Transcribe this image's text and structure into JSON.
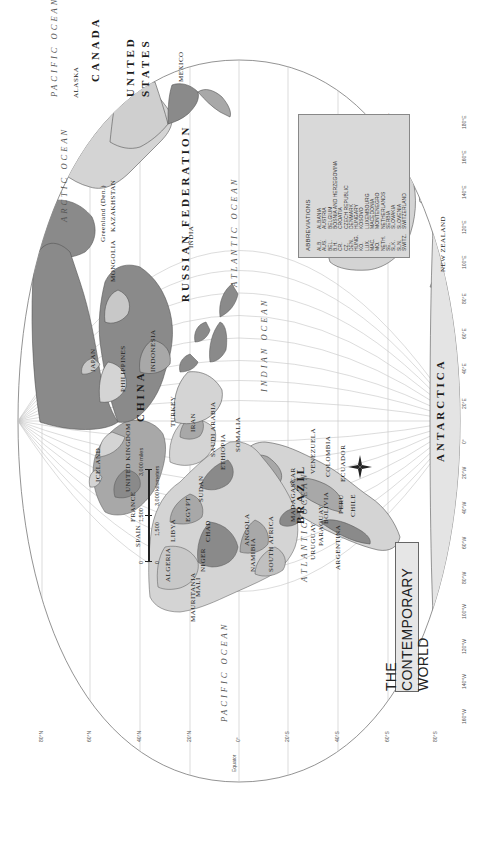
{
  "map": {
    "title": "THE CONTEMPORARY WORLD",
    "projection": "oval world projection, rotated 90° counter-clockwise",
    "colors": {
      "background": "#ffffff",
      "ocean": "#ffffff",
      "graticule": "#bdbdbd",
      "land_light": "#d4d4d4",
      "land_mid": "#a8a8a8",
      "land_dark": "#8a8a8a",
      "border": "#555555",
      "legend_bg": "#d9d9d9"
    },
    "oceans": [
      {
        "name": "ARCTIC OCEAN"
      },
      {
        "name": "PACIFIC OCEAN",
        "instance": "west"
      },
      {
        "name": "PACIFIC OCEAN",
        "instance": "east"
      },
      {
        "name": "ATLANTIC OCEAN",
        "instance": "north"
      },
      {
        "name": "ATLANTIC OCEAN",
        "instance": "south"
      },
      {
        "name": "INDIAN OCEAN"
      }
    ],
    "countries_large": [
      "CANADA",
      "UNITED STATES",
      "BRAZIL",
      "RUSSIAN FEDERATION",
      "CHINA",
      "AUSTRALIA",
      "ANTARCTICA",
      "INDIA",
      "MONGOLIA",
      "KAZAKHSTAN",
      "ALGERIA",
      "LIBYA",
      "SUDAN",
      "MALI",
      "NIGER",
      "CHAD",
      "MEXICO",
      "ARGENTINA"
    ],
    "countries_labeled": {
      "north_america": [
        "ALASKA",
        "CANADA",
        "UNITED STATES",
        "MEXICO",
        "CUBA",
        "BAHAMAS",
        "HAITI",
        "DOMINICAN REPUBLIC",
        "GUATEMALA",
        "EL SALVADOR",
        "HONDURAS",
        "NICARAGUA",
        "COSTA RICA",
        "PANAMA",
        "Greenland (Den.)",
        "ICELAND"
      ],
      "south_america": [
        "COLOMBIA",
        "VENEZUELA",
        "ECUADOR",
        "PERU",
        "BRAZIL",
        "BOLIVIA",
        "CHILE",
        "PARAGUAY",
        "URUGUAY",
        "ARGENTINA",
        "GUYANA",
        "SURINAME",
        "French Guiana (Fr.)",
        "TRINIDAD AND TOBAGO"
      ],
      "caribbean": [
        "ST. KITTS AND NEVIS",
        "ANTIGUA AND BARBUDA",
        "DOMINICA",
        "ST. VINCENT & THE GRENADINES",
        "BARBADOS",
        "GRENADA",
        "Puerto Rico (U.S.)"
      ],
      "europe": [
        "UNITED KINGDOM",
        "IRELAND",
        "NORWAY",
        "SWEDEN",
        "FINLAND",
        "ESTONIA",
        "LATVIA",
        "LITHUANIA",
        "BELARUS",
        "POLAND",
        "GERMANY",
        "FRANCE",
        "SPAIN",
        "PORTUGAL",
        "ITALY",
        "UKRAINE",
        "MOLDOVA",
        "ROMANIA",
        "BULGARIA",
        "GREECE",
        "TURKEY"
      ],
      "africa": [
        "MOROCCO",
        "Western Sahara",
        "ALGERIA",
        "TUNISIA",
        "LIBYA",
        "EGYPT",
        "MAURITANIA",
        "MALI",
        "NIGER",
        "CHAD",
        "SUDAN",
        "ERITREA",
        "ETHIOPIA",
        "SOMALIA",
        "DJIBOUTI",
        "CAPE VERDE",
        "SENEGAL",
        "GAMBIA",
        "GUINEA-BISSAU",
        "GUINEA",
        "SIERRA LEONE",
        "LIBERIA",
        "COTE D'IVOIRE",
        "BURKINA FASO",
        "GHANA",
        "TOGO",
        "BENIN",
        "NIGERIA",
        "CAMEROON",
        "CENTRAL AFRICAN REP.",
        "EQ. GUINEA",
        "GABON",
        "SAO TOME & PRINCIPE",
        "CONGO",
        "DEM. REP. OF THE CONGO",
        "UGANDA",
        "KENYA",
        "RWANDA",
        "BURUNDI",
        "TANZANIA",
        "ANGOLA",
        "ZAMBIA",
        "MALAWI",
        "MOZAMBIQUE",
        "ZIMBABWE",
        "NAMIBIA",
        "BOTSWANA",
        "SOUTH AFRICA",
        "SWAZILAND",
        "LESOTHO",
        "MADAGASCAR",
        "COMOROS",
        "SEYCHELLES",
        "MAURITIUS"
      ],
      "asia": [
        "RUSSIAN FEDERATION",
        "KAZAKHSTAN",
        "MONGOLIA",
        "CHINA",
        "JAPAN",
        "N. KOREA",
        "S. KOREA",
        "Taiwan",
        "INDIA",
        "PAKISTAN",
        "AFGHANISTAN",
        "IRAN",
        "IRAQ",
        "SYRIA",
        "SAUDI ARABIA",
        "YEMEN",
        "OMAN",
        "UNITED ARAB EMIRATES",
        "QATAR",
        "KUWAIT",
        "BHUTAN",
        "NEPAL",
        "BANGLADESH",
        "MYANMAR (BURMA)",
        "LAOS",
        "THAILAND",
        "VIETNAM",
        "CAMBODIA",
        "PHILIPPINES",
        "MALAYSIA",
        "BRUNEI",
        "SINGAPORE",
        "INDONESIA",
        "SRI LANKA",
        "MALDIVES",
        "TIMOR-LESTE",
        "UZBEKISTAN",
        "TURKMENISTAN",
        "KYRGYZSTAN",
        "TAJIKISTAN"
      ],
      "oceania": [
        "AUSTRALIA",
        "NEW ZEALAND",
        "PAPUA NEW GUINEA",
        "SOLOMON IS.",
        "VANUATU",
        "FIJI",
        "New Caledonia (Fr.)",
        "Tasmania (AUST.)",
        "PALAU",
        "FEDERATED STATES OF MICRONESIA",
        "MARSHALL IS.",
        "KIRIBATI",
        "NAURU",
        "TUVALU",
        "SAMOA",
        "TONGA",
        "Guam (U.S.)",
        "Mariana Is. (U.S.)",
        "Hawaii (U.S.)",
        "Easter I. (Chile)",
        "Galapagos Is. (Ec.)",
        "Falkland Is. (U.K.)",
        "Azores (Port.)",
        "Canary Is. (Sp.)"
      ]
    },
    "main_labels": [
      {
        "text": "RUSSIAN FEDERATION",
        "cls": "country-lg",
        "x": 540,
        "y": 180
      },
      {
        "text": "CHINA",
        "cls": "country-lg",
        "x": 420,
        "y": 135
      },
      {
        "text": "MONGOLIA",
        "cls": "country-md",
        "x": 560,
        "y": 110
      },
      {
        "text": "KAZAKHSTAN",
        "cls": "country-md",
        "x": 610,
        "y": 110
      },
      {
        "text": "INDIA",
        "cls": "country-md",
        "x": 594,
        "y": 188
      },
      {
        "text": "CANADA",
        "cls": "country-lg",
        "x": 760,
        "y": 90
      },
      {
        "text": "UNITED",
        "cls": "country-lg",
        "x": 745,
        "y": 125
      },
      {
        "text": "STATES",
        "cls": "country-lg",
        "x": 745,
        "y": 140
      },
      {
        "text": "MEXICO",
        "cls": "country-md",
        "x": 760,
        "y": 178
      },
      {
        "text": "ALASKA",
        "cls": "country-md",
        "x": 744,
        "y": 73
      },
      {
        "text": "BRAZIL",
        "cls": "country-lg",
        "x": 318,
        "y": 295
      },
      {
        "text": "PERU",
        "cls": "country-md",
        "x": 328,
        "y": 338
      },
      {
        "text": "CHILE",
        "cls": "country-md",
        "x": 325,
        "y": 350
      },
      {
        "text": "ARGENTINA",
        "cls": "country-md",
        "x": 272,
        "y": 335
      },
      {
        "text": "BOLIVIA",
        "cls": "country-md",
        "x": 318,
        "y": 323
      },
      {
        "text": "PARAGUAY",
        "cls": "country-md",
        "x": 296,
        "y": 318
      },
      {
        "text": "URUGUAY",
        "cls": "country-md",
        "x": 282,
        "y": 310
      },
      {
        "text": "COLOMBIA",
        "cls": "country-md",
        "x": 365,
        "y": 325
      },
      {
        "text": "VENEZUELA",
        "cls": "country-md",
        "x": 368,
        "y": 310
      },
      {
        "text": "ECUADOR",
        "cls": "country-md",
        "x": 360,
        "y": 340
      },
      {
        "text": "AUSTRALIA",
        "cls": "country-lg",
        "x": 640,
        "y": 380
      },
      {
        "text": "NEW ZEALAND",
        "cls": "country-md",
        "x": 570,
        "y": 440
      },
      {
        "text": "ANTARCTICA",
        "cls": "country-lg",
        "x": 380,
        "y": 435
      },
      {
        "text": "ALGERIA",
        "cls": "country-md",
        "x": 260,
        "y": 165
      },
      {
        "text": "LIBYA",
        "cls": "country-md",
        "x": 300,
        "y": 170
      },
      {
        "text": "EGYPT",
        "cls": "country-md",
        "x": 320,
        "y": 185
      },
      {
        "text": "SUDAN",
        "cls": "country-md",
        "x": 340,
        "y": 198
      },
      {
        "text": "MALI",
        "cls": "country-md",
        "x": 245,
        "y": 195
      },
      {
        "text": "NIGER",
        "cls": "country-md",
        "x": 270,
        "y": 200
      },
      {
        "text": "CHAD",
        "cls": "country-md",
        "x": 300,
        "y": 205
      },
      {
        "text": "MAURITANIA",
        "cls": "country-md",
        "x": 220,
        "y": 190
      },
      {
        "text": "ANGOLA",
        "cls": "country-md",
        "x": 296,
        "y": 244
      },
      {
        "text": "NAMIBIA",
        "cls": "country-md",
        "x": 270,
        "y": 250
      },
      {
        "text": "SOUTH AFRICA",
        "cls": "country-md",
        "x": 270,
        "y": 268
      },
      {
        "text": "MADAGASCAR",
        "cls": "country-md",
        "x": 320,
        "y": 290
      },
      {
        "text": "ETHIOPIA",
        "cls": "country-md",
        "x": 372,
        "y": 220
      },
      {
        "text": "SOMALIA",
        "cls": "country-md",
        "x": 390,
        "y": 235
      },
      {
        "text": "SAUDI ARABIA",
        "cls": "country-md",
        "x": 385,
        "y": 210
      },
      {
        "text": "IRAN",
        "cls": "country-md",
        "x": 410,
        "y": 190
      },
      {
        "text": "TURKEY",
        "cls": "country-md",
        "x": 415,
        "y": 170
      },
      {
        "text": "UNITED KINGDOM",
        "cls": "country-md",
        "x": 350,
        "y": 125
      },
      {
        "text": "FRANCE",
        "cls": "country-md",
        "x": 320,
        "y": 130
      },
      {
        "text": "SPAIN",
        "cls": "country-md",
        "x": 295,
        "y": 135
      },
      {
        "text": "ICELAND",
        "cls": "country-md",
        "x": 360,
        "y": 95
      },
      {
        "text": "Greenland (Den.)",
        "cls": "country-md",
        "x": 600,
        "y": 100
      },
      {
        "text": "JAPAN",
        "cls": "country-md",
        "x": 470,
        "y": 90
      },
      {
        "text": "PHILIPPINES",
        "cls": "country-md",
        "x": 450,
        "y": 120
      },
      {
        "text": "INDONESIA",
        "cls": "country-md",
        "x": 470,
        "y": 150
      }
    ],
    "ocean_labels": [
      {
        "text": "ARCTIC OCEAN",
        "x": 620,
        "y": 60
      },
      {
        "text": "PACIFIC OCEAN",
        "x": 745,
        "y": 50
      },
      {
        "text": "PACIFIC OCEAN",
        "x": 120,
        "y": 220
      },
      {
        "text": "ATLANTIC OCEAN",
        "x": 555,
        "y": 230
      },
      {
        "text": "ATLANTIC OCEAN",
        "x": 260,
        "y": 300
      },
      {
        "text": "INDIAN OCEAN",
        "x": 450,
        "y": 260
      }
    ],
    "latitude_ticks": [
      "80°N",
      "60°N",
      "40°N",
      "20°N",
      "0°",
      "20°S",
      "40°S",
      "60°S",
      "80°S"
    ],
    "longitude_ticks": [
      "160°W",
      "140°W",
      "120°W",
      "100°W",
      "80°W",
      "60°W",
      "40°W",
      "20°W",
      "0°",
      "20°E",
      "40°E",
      "60°E",
      "80°E",
      "100°E",
      "120°E",
      "140°E",
      "160°E",
      "180°E"
    ],
    "equator_label": "Equator",
    "scale": {
      "miles_ticks": [
        "0",
        "1,500",
        "3,000 miles"
      ],
      "km_ticks": [
        "0",
        "1,500",
        "3,000 kilometers"
      ]
    },
    "compass": {
      "n": "N",
      "s": "S",
      "e": "E",
      "w": "W"
    },
    "abbreviations": {
      "title": "ABBREVIATIONS",
      "items": [
        {
          "code": "ALB.",
          "name": "ALBANIA"
        },
        {
          "code": "AUS.",
          "name": "AUSTRIA"
        },
        {
          "code": "BEL.",
          "name": "BELGIUM"
        },
        {
          "code": "B.H.",
          "name": "BOSNIA AND HERZEGOVINA"
        },
        {
          "code": "CR.",
          "name": "CROATIA"
        },
        {
          "code": "CZ.",
          "name": "CZECH REPUBLIC"
        },
        {
          "code": "DEN.",
          "name": "DENMARK"
        },
        {
          "code": "HUNG.",
          "name": "HUNGARY"
        },
        {
          "code": "KO.",
          "name": "KOSOVO"
        },
        {
          "code": "LUX.",
          "name": "LUXEMBOURG"
        },
        {
          "code": "MAC.",
          "name": "MACEDONIA"
        },
        {
          "code": "MO.",
          "name": "MONTENEGRO"
        },
        {
          "code": "NETH.",
          "name": "NETHERLANDS"
        },
        {
          "code": "SE.",
          "name": "SERBIA"
        },
        {
          "code": "SLK.",
          "name": "SLOVAKIA"
        },
        {
          "code": "SLN.",
          "name": "SLOVENIA"
        },
        {
          "code": "SWITZ.",
          "name": "SWITZERLAND"
        }
      ]
    }
  }
}
